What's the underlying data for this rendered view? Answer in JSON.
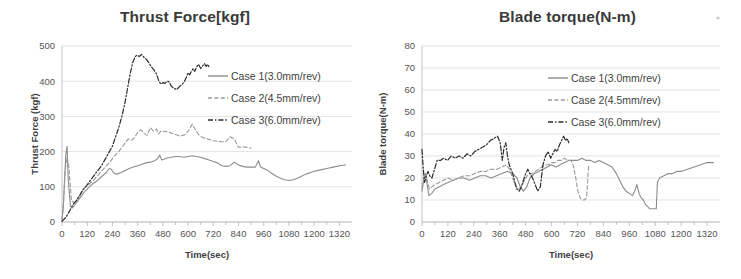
{
  "figure": {
    "background_color": "#ffffff",
    "artifact_dot": "speck"
  },
  "series_styles": {
    "case1": {
      "color": "#8c8c8c",
      "dash": "none",
      "width": 1.1
    },
    "case2": {
      "color": "#9a9a9a",
      "dash": "4,2.4",
      "width": 1.1
    },
    "case3": {
      "color": "#2b2b2b",
      "dash": "5,2,1.4,2",
      "width": 1.2
    }
  },
  "charts": [
    {
      "id": "thrust-force",
      "title": "Thrust Force[kgf]",
      "legend": [
        {
          "label": "Case 1(3.0mm/rev)",
          "key": "case1"
        },
        {
          "label": "Case 2(4.5mm/rev)",
          "key": "case2"
        },
        {
          "label": "Case 3(6.0mm/rev)",
          "key": "case3"
        }
      ]
    },
    {
      "id": "blade-torque",
      "title": "Blade torque(N-m)",
      "legend": [
        {
          "label": "Case 1(3.0mm/rev)",
          "key": "case1"
        },
        {
          "label": "Case 2(4.5mm/rev)",
          "key": "case2"
        },
        {
          "label": "Case 3(6.0mm/rev)",
          "key": "case3"
        }
      ]
    }
  ],
  "chart_data": [
    {
      "type": "line",
      "id": "thrust-force",
      "title": "Thrust Force[kgf]",
      "xlabel": "Time(sec)",
      "ylabel": "Thrust Force (kgf)",
      "xlim": [
        0,
        1380
      ],
      "ylim": [
        0,
        500
      ],
      "xticks": [
        0,
        120,
        240,
        360,
        480,
        600,
        720,
        840,
        960,
        1080,
        1200,
        1320
      ],
      "yticks": [
        0,
        100,
        200,
        300,
        400,
        500
      ],
      "grid": true,
      "legend_position": "upper right",
      "series": [
        {
          "name": "Case 1(3.0mm/rev)",
          "style": "case1",
          "x": [
            0,
            6,
            12,
            18,
            24,
            30,
            40,
            50,
            60,
            75,
            90,
            110,
            130,
            150,
            170,
            190,
            210,
            225,
            235,
            245,
            260,
            280,
            300,
            320,
            340,
            360,
            380,
            400,
            420,
            440,
            455,
            465,
            475,
            485,
            500,
            520,
            540,
            560,
            580,
            600,
            620,
            640,
            660,
            680,
            700,
            720,
            740,
            760,
            780,
            800,
            820,
            840,
            860,
            880,
            900,
            920,
            935,
            945,
            960,
            980,
            1000,
            1020,
            1040,
            1060,
            1080,
            1100,
            1120,
            1140,
            1160,
            1180,
            1200,
            1230,
            1260,
            1290,
            1320,
            1350
          ],
          "y": [
            5,
            40,
            120,
            190,
            215,
            120,
            45,
            40,
            48,
            60,
            72,
            88,
            100,
            110,
            118,
            130,
            140,
            152,
            150,
            140,
            136,
            140,
            146,
            152,
            156,
            160,
            164,
            168,
            170,
            174,
            180,
            190,
            176,
            178,
            182,
            184,
            186,
            186,
            184,
            186,
            188,
            186,
            184,
            180,
            176,
            172,
            168,
            160,
            158,
            160,
            170,
            162,
            158,
            156,
            156,
            156,
            174,
            156,
            152,
            146,
            138,
            130,
            124,
            120,
            118,
            120,
            124,
            130,
            136,
            140,
            144,
            148,
            152,
            156,
            160,
            162
          ]
        },
        {
          "name": "Case 2(4.5mm/rev)",
          "style": "case2",
          "x": [
            0,
            8,
            16,
            24,
            32,
            45,
            60,
            75,
            90,
            110,
            130,
            150,
            170,
            190,
            210,
            230,
            250,
            270,
            285,
            300,
            315,
            330,
            345,
            360,
            375,
            390,
            405,
            420,
            435,
            450,
            460,
            470,
            480,
            490,
            500,
            515,
            530,
            545,
            560,
            575,
            590,
            605,
            620,
            635,
            650,
            660,
            670,
            680,
            695,
            710,
            725,
            740,
            760,
            780,
            800,
            820,
            840,
            860,
            880,
            900
          ],
          "y": [
            5,
            60,
            150,
            185,
            160,
            60,
            55,
            68,
            82,
            98,
            108,
            118,
            132,
            146,
            158,
            172,
            188,
            200,
            212,
            224,
            236,
            232,
            240,
            254,
            262,
            252,
            246,
            268,
            258,
            264,
            250,
            258,
            256,
            258,
            256,
            254,
            250,
            248,
            244,
            246,
            250,
            262,
            278,
            262,
            248,
            244,
            240,
            238,
            236,
            232,
            230,
            230,
            228,
            228,
            242,
            236,
            212,
            214,
            212,
            210
          ]
        },
        {
          "name": "Case 3(6.0mm/rev)",
          "style": "case3",
          "x": [
            0,
            10,
            20,
            30,
            42,
            55,
            70,
            85,
            100,
            118,
            135,
            152,
            170,
            188,
            205,
            222,
            240,
            255,
            270,
            285,
            300,
            312,
            324,
            336,
            348,
            358,
            368,
            378,
            390,
            402,
            414,
            426,
            438,
            450,
            462,
            472,
            480,
            490,
            500,
            510,
            520,
            532,
            545,
            558,
            570,
            582,
            592,
            600,
            608,
            616,
            624,
            632,
            640,
            650,
            660,
            670,
            678,
            686,
            694,
            700
          ],
          "y": [
            2,
            8,
            14,
            25,
            38,
            52,
            62,
            76,
            92,
            104,
            118,
            132,
            146,
            160,
            178,
            196,
            216,
            242,
            268,
            300,
            340,
            380,
            420,
            452,
            470,
            474,
            470,
            476,
            468,
            462,
            452,
            440,
            432,
            420,
            398,
            392,
            396,
            394,
            400,
            398,
            386,
            380,
            376,
            384,
            390,
            398,
            412,
            424,
            418,
            428,
            436,
            428,
            440,
            448,
            436,
            444,
            450,
            442,
            448,
            440
          ]
        }
      ]
    },
    {
      "type": "line",
      "id": "blade-torque",
      "title": "Blade torque(N-m)",
      "xlabel": "Time(sec)",
      "ylabel": "Blade torque(N-m)",
      "xlim": [
        0,
        1380
      ],
      "ylim": [
        0,
        80
      ],
      "xticks": [
        0,
        120,
        240,
        360,
        480,
        600,
        720,
        840,
        960,
        1080,
        1200,
        1320
      ],
      "yticks": [
        0,
        10,
        20,
        30,
        40,
        50,
        60,
        70,
        80
      ],
      "grid": true,
      "legend_position": "upper right",
      "series": [
        {
          "name": "Case 1(3.0mm/rev)",
          "style": "case1",
          "x": [
            0,
            8,
            16,
            24,
            32,
            45,
            60,
            80,
            100,
            120,
            145,
            170,
            195,
            220,
            245,
            270,
            295,
            320,
            345,
            370,
            395,
            420,
            440,
            455,
            470,
            485,
            500,
            520,
            540,
            560,
            580,
            600,
            620,
            640,
            660,
            680,
            700,
            720,
            740,
            760,
            780,
            800,
            820,
            840,
            860,
            880,
            900,
            915,
            930,
            945,
            960,
            975,
            985,
            995,
            1005,
            1015,
            1025,
            1035,
            1045,
            1055,
            1065,
            1075,
            1085,
            1090,
            1100,
            1120,
            1140,
            1160,
            1180,
            1200,
            1230,
            1260,
            1290,
            1320,
            1350
          ],
          "y": [
            14,
            19,
            22,
            17,
            12,
            13,
            15,
            16,
            17,
            18,
            19,
            20,
            20,
            19,
            20,
            21,
            21,
            20,
            21,
            22,
            23,
            22,
            20,
            16,
            14,
            16,
            20,
            22,
            23,
            24,
            25,
            26,
            25,
            26,
            27,
            28,
            28,
            28,
            29,
            28,
            28,
            27,
            28,
            27,
            26,
            25,
            22,
            19,
            16,
            14,
            13,
            12,
            14,
            17,
            13,
            11,
            10,
            8,
            7,
            6,
            6,
            6,
            6,
            18,
            20,
            21,
            22,
            22,
            23,
            23,
            24,
            25,
            26,
            27,
            27
          ]
        },
        {
          "name": "Case 2(4.5mm/rev)",
          "style": "case2",
          "x": [
            0,
            8,
            16,
            24,
            34,
            46,
            60,
            80,
            100,
            120,
            145,
            170,
            195,
            220,
            245,
            270,
            295,
            320,
            345,
            370,
            390,
            405,
            420,
            435,
            450,
            465,
            480,
            495,
            510,
            525,
            540,
            555,
            570,
            585,
            600,
            615,
            630,
            645,
            660,
            675,
            690,
            700,
            712,
            722,
            732,
            742,
            752,
            762,
            772
          ],
          "y": [
            16,
            20,
            22,
            19,
            15,
            16,
            17,
            18,
            19,
            20,
            19,
            20,
            21,
            21,
            22,
            23,
            23,
            24,
            24,
            25,
            26,
            24,
            20,
            16,
            15,
            17,
            20,
            22,
            22,
            23,
            24,
            25,
            26,
            26,
            27,
            27,
            28,
            28,
            29,
            28,
            28,
            26,
            20,
            14,
            11,
            10,
            10,
            11,
            26
          ]
        },
        {
          "name": "Case 3(6.0mm/rev)",
          "style": "case3",
          "x": [
            0,
            6,
            12,
            20,
            28,
            36,
            46,
            58,
            70,
            85,
            100,
            118,
            136,
            154,
            172,
            190,
            208,
            226,
            244,
            262,
            280,
            298,
            316,
            334,
            350,
            362,
            372,
            380,
            388,
            396,
            404,
            412,
            420,
            430,
            440,
            450,
            460,
            470,
            480,
            490,
            500,
            512,
            524,
            536,
            548,
            560,
            572,
            584,
            596,
            606,
            616,
            626,
            636,
            646,
            656,
            664,
            672,
            680
          ],
          "y": [
            33,
            24,
            18,
            21,
            23,
            21,
            20,
            24,
            28,
            28,
            29,
            28,
            30,
            29,
            30,
            29,
            31,
            30,
            32,
            33,
            34,
            35,
            37,
            38,
            39,
            36,
            28,
            34,
            36,
            30,
            26,
            24,
            22,
            18,
            15,
            14,
            16,
            19,
            22,
            24,
            22,
            20,
            17,
            14,
            16,
            26,
            30,
            32,
            29,
            31,
            33,
            32,
            35,
            37,
            39,
            37,
            38,
            36
          ]
        }
      ]
    }
  ]
}
